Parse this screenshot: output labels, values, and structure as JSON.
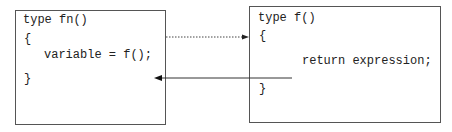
{
  "caller": {
    "signature": "type fn()",
    "open_brace": "{",
    "statement": "variable = f();",
    "close_brace": "}"
  },
  "callee": {
    "signature": "type f()",
    "open_brace": "{",
    "statement": "return expression;",
    "close_brace": "}"
  },
  "arrows": [
    {
      "name": "call-arrow",
      "style": "dotted",
      "from": "caller",
      "to": "callee"
    },
    {
      "name": "return-arrow",
      "style": "solid",
      "from": "callee",
      "to": "caller"
    }
  ]
}
